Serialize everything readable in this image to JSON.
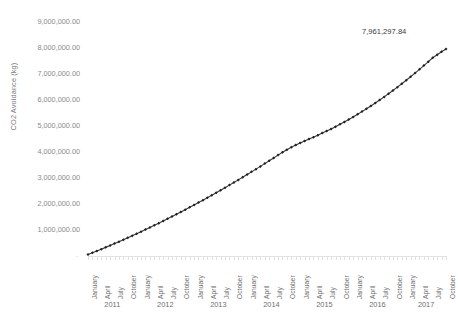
{
  "chart_data": {
    "type": "line",
    "title": "",
    "xlabel": "",
    "ylabel": "CO2 Avoidance (kg)",
    "ylim": [
      0,
      9000000
    ],
    "ytick_labels": [
      "9,000,000.00",
      "8,000,000.00",
      "7,000,000.00",
      "6,000,000.00",
      "5,000,000.00",
      "4,000,000.00",
      "3,000,000.00",
      "2,000,000.00",
      "1,000,000.00",
      "-"
    ],
    "ytick_values": [
      9000000,
      8000000,
      7000000,
      6000000,
      5000000,
      4000000,
      3000000,
      2000000,
      1000000,
      0
    ],
    "grid": false,
    "legend": "none",
    "marker": "diamond",
    "line_color": "#3a3a3a",
    "marker_color": "#1f1f1f",
    "annotations": [
      {
        "text": "7,961,297.84",
        "series": "CO2 Avoidance (kg)",
        "x": "October 2017",
        "y": 7961297.84
      }
    ],
    "x_tick_labels": [
      "January",
      "April",
      "July",
      "October"
    ],
    "year_groups": [
      "2011",
      "2012",
      "2013",
      "2014",
      "2015",
      "2016",
      "2017"
    ],
    "x": [
      "January 2011",
      "February 2011",
      "March 2011",
      "April 2011",
      "May 2011",
      "June 2011",
      "July 2011",
      "August 2011",
      "September 2011",
      "October 2011",
      "November 2011",
      "December 2011",
      "January 2012",
      "February 2012",
      "March 2012",
      "April 2012",
      "May 2012",
      "June 2012",
      "July 2012",
      "August 2012",
      "September 2012",
      "October 2012",
      "November 2012",
      "December 2012",
      "January 2013",
      "February 2013",
      "March 2013",
      "April 2013",
      "May 2013",
      "June 2013",
      "July 2013",
      "August 2013",
      "September 2013",
      "October 2013",
      "November 2013",
      "December 2013",
      "January 2014",
      "February 2014",
      "March 2014",
      "April 2014",
      "May 2014",
      "June 2014",
      "July 2014",
      "August 2014",
      "September 2014",
      "October 2014",
      "November 2014",
      "December 2014",
      "January 2015",
      "February 2015",
      "March 2015",
      "April 2015",
      "May 2015",
      "June 2015",
      "July 2015",
      "August 2015",
      "September 2015",
      "October 2015",
      "November 2015",
      "December 2015",
      "January 2016",
      "February 2016",
      "March 2016",
      "April 2016",
      "May 2016",
      "June 2016",
      "July 2016",
      "August 2016",
      "September 2016",
      "October 2016",
      "November 2016",
      "December 2016",
      "January 2017",
      "February 2017",
      "March 2017",
      "April 2017",
      "May 2017",
      "June 2017",
      "July 2017",
      "August 2017",
      "September 2017",
      "October 2017"
    ],
    "series": [
      {
        "name": "CO2 Avoidance (kg)",
        "values": [
          60000,
          125000,
          193000,
          262000,
          332000,
          404000,
          477000,
          551000,
          626000,
          702000,
          779000,
          857000,
          936000,
          1016000,
          1097000,
          1179000,
          1262000,
          1346000,
          1431000,
          1517000,
          1604000,
          1692000,
          1781000,
          1871000,
          1962000,
          2054000,
          2147000,
          2241000,
          2336000,
          2432000,
          2529000,
          2627000,
          2726000,
          2826000,
          2927000,
          3029000,
          3132000,
          3236000,
          3341000,
          3447000,
          3554000,
          3662000,
          3771000,
          3881000,
          3988000,
          4088000,
          4180000,
          4265000,
          4345000,
          4422000,
          4497000,
          4572000,
          4648000,
          4726000,
          4806000,
          4889000,
          4975000,
          5064000,
          5156000,
          5251000,
          5349000,
          5450000,
          5554000,
          5661000,
          5771000,
          5884000,
          6000000,
          6119000,
          6241000,
          6366000,
          6494000,
          6625000,
          6759000,
          6896000,
          7036000,
          7179000,
          7325000,
          7474000,
          7626000,
          7740000,
          7855000,
          7961297.84
        ]
      }
    ]
  },
  "axis": {
    "y_title": "CO2 Avoidance (kg)"
  }
}
